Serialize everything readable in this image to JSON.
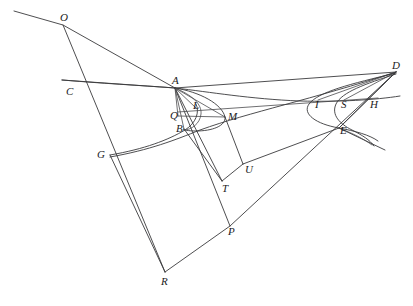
{
  "figure": {
    "background_color": "#ffffff",
    "stroke_color": "#3a3a3c",
    "label_color": "#1b1b1d",
    "width": 413,
    "height": 306
  },
  "points": [
    {
      "id": "O",
      "label": "O",
      "x": 63,
      "y": 25,
      "label_x": 60,
      "label_y": 12
    },
    {
      "id": "C",
      "label": "C",
      "x": 78,
      "y": 88,
      "label_x": 66,
      "label_y": 86
    },
    {
      "id": "A",
      "label": "A",
      "x": 175,
      "y": 88,
      "label_x": 172,
      "label_y": 75
    },
    {
      "id": "L",
      "label": "L",
      "x": 196,
      "y": 108,
      "label_x": 193,
      "label_y": 100
    },
    {
      "id": "Q",
      "label": "Q",
      "x": 178,
      "y": 116,
      "label_x": 170,
      "label_y": 110
    },
    {
      "id": "B",
      "label": "B",
      "x": 184,
      "y": 129,
      "label_x": 176,
      "label_y": 123
    },
    {
      "id": "M",
      "label": "M",
      "x": 225,
      "y": 117,
      "label_x": 228,
      "label_y": 111
    },
    {
      "id": "G",
      "label": "G",
      "x": 110,
      "y": 155,
      "label_x": 97,
      "label_y": 149
    },
    {
      "id": "T",
      "label": "T",
      "x": 222,
      "y": 181,
      "label_x": 222,
      "label_y": 183
    },
    {
      "id": "U",
      "label": "U",
      "x": 243,
      "y": 164,
      "label_x": 245,
      "label_y": 164
    },
    {
      "id": "P",
      "label": "P",
      "x": 230,
      "y": 226,
      "label_x": 228,
      "label_y": 226
    },
    {
      "id": "R",
      "label": "R",
      "x": 165,
      "y": 272,
      "label_x": 161,
      "label_y": 276
    },
    {
      "id": "I",
      "label": "I",
      "x": 318,
      "y": 100,
      "label_x": 315,
      "label_y": 99
    },
    {
      "id": "S",
      "label": "S",
      "x": 344,
      "y": 100,
      "label_x": 341,
      "label_y": 99
    },
    {
      "id": "H",
      "label": "H",
      "x": 372,
      "y": 100,
      "label_x": 370,
      "label_y": 99
    },
    {
      "id": "E",
      "label": "E",
      "x": 339,
      "y": 128,
      "label_x": 340,
      "label_y": 125
    },
    {
      "id": "D",
      "label": "D",
      "x": 396,
      "y": 72,
      "label_x": 392,
      "label_y": 60
    }
  ],
  "segments": [
    {
      "name": "ray-through-O-upper-left",
      "from": "edge-upper-left",
      "to": "A",
      "d": "M 14 11 L 63 25 L 175 88"
    },
    {
      "name": "line-O-to-R",
      "from": "O",
      "to": "R",
      "d": "M 63 25 L 165 272"
    },
    {
      "name": "line-O-to-A-chord",
      "from": "O",
      "to": "A",
      "d": "M 63 25 L 175 88"
    },
    {
      "name": "line-G-to-R",
      "from": "G",
      "to": "R",
      "d": "M 110 155 L 165 272"
    },
    {
      "name": "line-R-to-D",
      "from": "R",
      "to": "D",
      "d": "M 165 272 L 230 226 L 396 72"
    },
    {
      "name": "line-A-to-P",
      "from": "A",
      "to": "P",
      "d": "M 175 88 L 230 226"
    },
    {
      "name": "line-A-to-T",
      "from": "A",
      "to": "T",
      "d": "M 175 88 L 222 181"
    },
    {
      "name": "line-B-to-T",
      "from": "B",
      "to": "T",
      "d": "M 184 129 L 222 181"
    },
    {
      "name": "line-T-to-U",
      "from": "T",
      "to": "U",
      "d": "M 222 181 L 243 164"
    },
    {
      "name": "line-M-to-U",
      "from": "M",
      "to": "U",
      "d": "M 225 117 L 243 164"
    },
    {
      "name": "line-A-to-M",
      "from": "A",
      "to": "M",
      "d": "M 175 88 L 225 117"
    },
    {
      "name": "line-A-to-L",
      "from": "A",
      "to": "L",
      "d": "M 175 88 L 196 108"
    },
    {
      "name": "line-A-to-B",
      "from": "A",
      "to": "B",
      "d": "M 175 88 L 184 129"
    },
    {
      "name": "line-A-to-Q",
      "from": "A",
      "to": "Q",
      "d": "M 175 88 L 178 116"
    },
    {
      "name": "line-Q-to-M",
      "from": "Q",
      "to": "M",
      "d": "M 178 116 L 225 117"
    },
    {
      "name": "line-A-to-D-upper",
      "from": "A",
      "to": "D",
      "d": "M 175 88 L 396 72"
    },
    {
      "name": "line-A-to-D-lower",
      "from": "A",
      "to": "D",
      "d": "M 175 88 L 310 101 L 396 72"
    },
    {
      "name": "line-Q-to-H",
      "from": "Q",
      "to": "H",
      "d": "M 178 112 L 378 98"
    },
    {
      "name": "line-D-to-E",
      "from": "D",
      "to": "E",
      "d": "M 396 72 L 339 128"
    },
    {
      "name": "line-D-to-I",
      "from": "D",
      "to": "I",
      "d": "M 396 72 L 318 100"
    },
    {
      "name": "line-D-to-S",
      "from": "D",
      "to": "S",
      "d": "M 396 72 L 344 100"
    },
    {
      "name": "line-U-to-E-extended",
      "from": "U",
      "to": "E",
      "d": "M 243 164 L 339 128 L 396 72"
    },
    {
      "name": "line-E-ray-lower-right",
      "from": "E",
      "to": "edge-right",
      "d": "M 339 128 L 385 150"
    },
    {
      "name": "line-C-ray-left",
      "from": "edge-left",
      "to": "A",
      "d": "M 62 80 L 175 88"
    }
  ],
  "curves": [
    {
      "name": "conic-through-C-A",
      "d": "M 62 80 C 110 84, 150 86, 175 88 C 210 92, 250 99, 300 101 C 340 102, 375 100, 400 96"
    },
    {
      "name": "conic-outer-G-B-to-D",
      "d": "M 110 157 C 150 150, 175 140, 200 130 C 250 112, 310 100, 396 72"
    },
    {
      "name": "conic-inner-G-B-to-A",
      "d": "M 110 155 C 145 149, 168 140, 185 130 C 196 123, 200 112, 196 104"
    },
    {
      "name": "ellipse-arc-A-M-B",
      "d": "M 175 88 C 200 92, 222 104, 225 117 C 226 126, 212 131, 196 131 C 186 131, 181 129, 184 129"
    },
    {
      "name": "ellipse-arc-A-L-B-inner",
      "d": "M 175 88 C 192 95, 202 104, 201 114 C 200 124, 191 130, 184 130"
    },
    {
      "name": "parabola-I-E-open-left",
      "d": "M 396 73 C 350 84, 318 92, 309 104 C 302 114, 316 124, 339 128 C 355 131, 370 135, 378 141"
    },
    {
      "name": "parabola-S-E-open-left",
      "d": "M 396 74 C 365 84, 342 92, 336 104 C 331 115, 340 124, 352 130 C 362 135, 370 140, 374 146"
    },
    {
      "name": "curve-E-tail-right",
      "d": "M 339 128 C 352 133, 364 139, 372 145"
    }
  ]
}
